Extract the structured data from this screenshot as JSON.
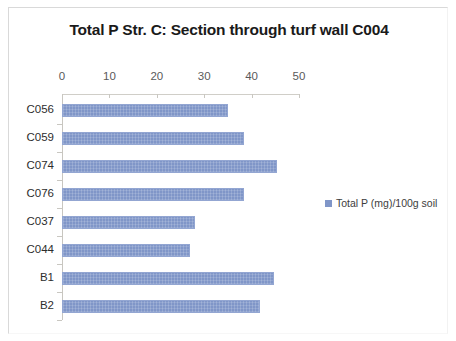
{
  "chart_data": {
    "type": "bar",
    "orientation": "horizontal",
    "title": "Total P Str. C: Section through turf wall C004",
    "xlabel": "",
    "ylabel": "",
    "categories": [
      "C056",
      "C059",
      "C074",
      "C076",
      "C037",
      "C044",
      "B1",
      "B2"
    ],
    "series": [
      {
        "name": "Total P (mg)/100g soil",
        "values": [
          35,
          38.5,
          45.3,
          38.4,
          28,
          27,
          44.7,
          41.8
        ]
      }
    ],
    "xlim": [
      0,
      50
    ],
    "xticks": [
      0,
      10,
      20,
      30,
      40,
      50
    ],
    "xtick_labels": [
      "0",
      "10",
      "20",
      "30",
      "40",
      "50"
    ],
    "grid": false,
    "legend_position": "right",
    "bar_color": "#8096c8",
    "axis_color": "#c9c7c1",
    "title_color": "#1a1a1a",
    "tick_label_color": "#5a5a5a"
  },
  "legend": {
    "entries": [
      {
        "label": "Total P (mg)/100g soil",
        "color": "#8096c8"
      }
    ]
  }
}
